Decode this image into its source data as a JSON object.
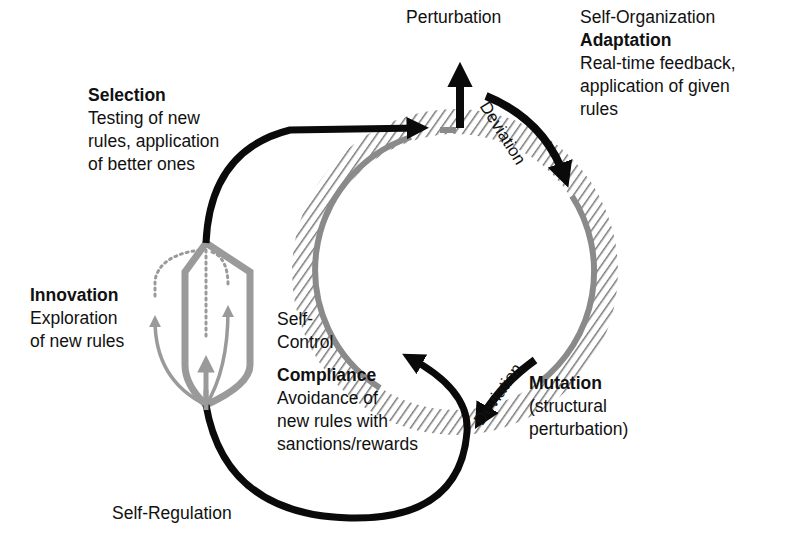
{
  "diagram": {
    "colors": {
      "arrow": "#0a0a0a",
      "ring": "#8a8a8a",
      "hatch": "#777777",
      "innovation": "#9a9a9a",
      "text": "#111111",
      "mode_label": "#555555"
    },
    "top": {
      "perturbation": "Perturbation",
      "self_organization": "Self-Organization"
    },
    "adaptation": {
      "title": "Adaptation",
      "desc_lines": [
        "Real-time feedback,",
        "application of given",
        "rules"
      ]
    },
    "selection": {
      "title": "Selection",
      "desc_lines": [
        "Testing of new",
        "rules, application",
        "of better ones"
      ]
    },
    "innovation": {
      "title": "Innovation",
      "desc_lines": [
        "Exploration",
        "of new rules"
      ]
    },
    "self_control": {
      "lines": [
        "Self-",
        "Control"
      ]
    },
    "compliance": {
      "title": "Compliance",
      "desc_lines": [
        "Avoidance of",
        "new rules with",
        "sanctions/rewards"
      ]
    },
    "mutation": {
      "title": "Mutation",
      "desc_lines": [
        "(structural",
        "perturbation)"
      ]
    },
    "self_regulation": "Self-Regulation",
    "deviation_top": "Deviation",
    "deviation_bottom": "Deviation"
  }
}
